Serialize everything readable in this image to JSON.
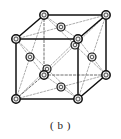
{
  "figure": {
    "caption": "( b )"
  },
  "colors": {
    "background": "#ffffff",
    "edge_solid": "#101010",
    "edge_hidden": "#6e6e6e",
    "diagonal": "#8a8a8a",
    "atom_fill": "#e8e8e8",
    "atom_stroke": "#101010",
    "atom_core": "#f5f5f5",
    "caption_text": "#1a1a1a"
  },
  "geometry": {
    "projection": "oblique",
    "front_face": {
      "top_left": [
        16,
        39
      ],
      "top_right": [
        78,
        39
      ],
      "bottom_right": [
        78,
        99
      ],
      "bottom_left": [
        16,
        99
      ]
    },
    "back_face": {
      "top_left": [
        44,
        15
      ],
      "top_right": [
        106,
        15
      ],
      "bottom_right": [
        106,
        75
      ],
      "bottom_left": [
        44,
        75
      ]
    },
    "offset": [
      28,
      -24
    ]
  },
  "lattice": {
    "type": "face-centered cubic",
    "corner_atom_count": 8,
    "face_atom_count": 6,
    "corner_radius": 4.2,
    "face_radius": 4.0,
    "corner_atoms": [
      {
        "name": "corner-front-top-left",
        "x": 16,
        "y": 39,
        "visible": true
      },
      {
        "name": "corner-front-top-right",
        "x": 78,
        "y": 39,
        "visible": true
      },
      {
        "name": "corner-front-bottom-left",
        "x": 16,
        "y": 99,
        "visible": true
      },
      {
        "name": "corner-front-bottom-right",
        "x": 78,
        "y": 99,
        "visible": true
      },
      {
        "name": "corner-back-top-left",
        "x": 44,
        "y": 15,
        "visible": true
      },
      {
        "name": "corner-back-top-right",
        "x": 106,
        "y": 15,
        "visible": true
      },
      {
        "name": "corner-back-bottom-left",
        "x": 44,
        "y": 75,
        "visible": false
      },
      {
        "name": "corner-back-bottom-right",
        "x": 106,
        "y": 75,
        "visible": true
      }
    ],
    "face_atoms": [
      {
        "name": "face-center-top",
        "x": 61,
        "y": 27,
        "visible": true
      },
      {
        "name": "face-center-bottom",
        "x": 61,
        "y": 87,
        "visible": false
      },
      {
        "name": "face-center-left",
        "x": 30,
        "y": 57,
        "visible": false
      },
      {
        "name": "face-center-right",
        "x": 92,
        "y": 57,
        "visible": false
      },
      {
        "name": "face-center-front",
        "x": 47,
        "y": 69,
        "visible": true
      },
      {
        "name": "face-center-back",
        "x": 75,
        "y": 45,
        "visible": false
      }
    ],
    "solid_edges": [
      {
        "name": "edge-front-top",
        "from": [
          16,
          39
        ],
        "to": [
          78,
          39
        ]
      },
      {
        "name": "edge-front-left",
        "from": [
          16,
          39
        ],
        "to": [
          16,
          99
        ]
      },
      {
        "name": "edge-front-right",
        "from": [
          78,
          39
        ],
        "to": [
          78,
          99
        ]
      },
      {
        "name": "edge-front-bottom",
        "from": [
          16,
          99
        ],
        "to": [
          78,
          99
        ]
      },
      {
        "name": "edge-back-top",
        "from": [
          44,
          15
        ],
        "to": [
          106,
          15
        ]
      },
      {
        "name": "edge-back-right",
        "from": [
          106,
          15
        ],
        "to": [
          106,
          75
        ]
      },
      {
        "name": "edge-top-left-diag",
        "from": [
          16,
          39
        ],
        "to": [
          44,
          15
        ]
      },
      {
        "name": "edge-top-right-diag",
        "from": [
          78,
          39
        ],
        "to": [
          106,
          15
        ]
      },
      {
        "name": "edge-bottom-right-diag",
        "from": [
          78,
          99
        ],
        "to": [
          106,
          75
        ]
      }
    ],
    "hidden_edges": [
      {
        "name": "edge-back-left",
        "from": [
          44,
          15
        ],
        "to": [
          44,
          75
        ]
      },
      {
        "name": "edge-back-bottom",
        "from": [
          44,
          75
        ],
        "to": [
          106,
          75
        ]
      },
      {
        "name": "edge-bottom-left-diag",
        "from": [
          16,
          99
        ],
        "to": [
          44,
          75
        ]
      }
    ],
    "diagonals": [
      {
        "name": "diag-top-face-1",
        "from": [
          16,
          39
        ],
        "to": [
          61,
          27
        ],
        "via": "top-face"
      },
      {
        "name": "diag-top-face-2",
        "from": [
          78,
          39
        ],
        "to": [
          61,
          27
        ],
        "via": "top-face"
      },
      {
        "name": "diag-top-face-3",
        "from": [
          44,
          15
        ],
        "to": [
          61,
          27
        ],
        "via": "top-face"
      },
      {
        "name": "diag-top-face-4",
        "from": [
          106,
          15
        ],
        "to": [
          61,
          27
        ],
        "via": "top-face"
      },
      {
        "name": "diag-bottom-face-1",
        "from": [
          16,
          99
        ],
        "to": [
          61,
          87
        ],
        "via": "bottom-face"
      },
      {
        "name": "diag-bottom-face-2",
        "from": [
          78,
          99
        ],
        "to": [
          61,
          87
        ],
        "via": "bottom-face"
      },
      {
        "name": "diag-bottom-face-3",
        "from": [
          44,
          75
        ],
        "to": [
          61,
          87
        ],
        "via": "bottom-face"
      },
      {
        "name": "diag-bottom-face-4",
        "from": [
          106,
          75
        ],
        "to": [
          61,
          87
        ],
        "via": "bottom-face"
      },
      {
        "name": "diag-left-face-1",
        "from": [
          16,
          39
        ],
        "to": [
          30,
          57
        ],
        "via": "left-face"
      },
      {
        "name": "diag-left-face-2",
        "from": [
          16,
          99
        ],
        "to": [
          30,
          57
        ],
        "via": "left-face"
      },
      {
        "name": "diag-left-face-3",
        "from": [
          44,
          15
        ],
        "to": [
          30,
          57
        ],
        "via": "left-face"
      },
      {
        "name": "diag-left-face-4",
        "from": [
          44,
          75
        ],
        "to": [
          30,
          57
        ],
        "via": "left-face"
      },
      {
        "name": "diag-right-face-1",
        "from": [
          78,
          39
        ],
        "to": [
          92,
          57
        ],
        "via": "right-face"
      },
      {
        "name": "diag-right-face-2",
        "from": [
          78,
          99
        ],
        "to": [
          92,
          57
        ],
        "via": "right-face"
      },
      {
        "name": "diag-right-face-3",
        "from": [
          106,
          15
        ],
        "to": [
          92,
          57
        ],
        "via": "right-face"
      },
      {
        "name": "diag-right-face-4",
        "from": [
          106,
          75
        ],
        "to": [
          92,
          57
        ],
        "via": "right-face"
      },
      {
        "name": "diag-front-face-1",
        "from": [
          16,
          39
        ],
        "to": [
          47,
          69
        ],
        "via": "front-face"
      },
      {
        "name": "diag-front-face-2",
        "from": [
          78,
          39
        ],
        "to": [
          47,
          69
        ],
        "via": "front-face"
      },
      {
        "name": "diag-front-face-3",
        "from": [
          16,
          99
        ],
        "to": [
          47,
          69
        ],
        "via": "front-face"
      },
      {
        "name": "diag-front-face-4",
        "from": [
          78,
          99
        ],
        "to": [
          47,
          69
        ],
        "via": "front-face"
      },
      {
        "name": "diag-back-face-1",
        "from": [
          44,
          15
        ],
        "to": [
          75,
          45
        ],
        "via": "back-face"
      },
      {
        "name": "diag-back-face-2",
        "from": [
          106,
          15
        ],
        "to": [
          75,
          45
        ],
        "via": "back-face"
      },
      {
        "name": "diag-back-face-3",
        "from": [
          44,
          75
        ],
        "to": [
          75,
          45
        ],
        "via": "back-face"
      },
      {
        "name": "diag-back-face-4",
        "from": [
          106,
          75
        ],
        "to": [
          75,
          45
        ],
        "via": "back-face"
      }
    ]
  }
}
